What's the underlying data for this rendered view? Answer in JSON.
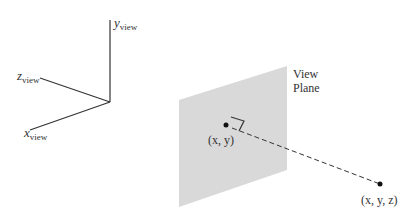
{
  "diagram": {
    "axes": {
      "y_label": "y",
      "y_sub": "view",
      "z_label": "z",
      "z_sub": "view",
      "x_label": "x",
      "x_sub": "view"
    },
    "plane": {
      "label_line1": "View",
      "label_line2": "Plane",
      "fill_color": "#d9d9d9"
    },
    "points": {
      "projected_label": "(x, y)",
      "world_label": "(x, y, z)"
    },
    "colors": {
      "line": "#333333",
      "text": "#333333",
      "background": "#ffffff"
    }
  }
}
